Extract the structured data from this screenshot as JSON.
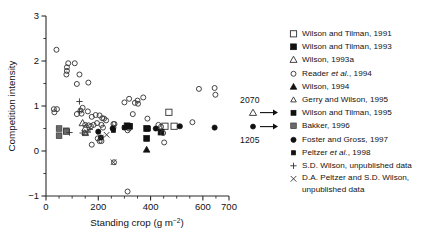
{
  "chart_data": {
    "type": "scatter",
    "title": "",
    "xlabel": "Standing crop (g m−2)",
    "ylabel": "Competition intensity",
    "xlim": [
      0,
      700
    ],
    "ylim": [
      -1,
      3
    ],
    "xticks": [
      0,
      200,
      400,
      600,
      700
    ],
    "xtick_labels": [
      "0",
      "200",
      "400",
      "600",
      "700"
    ],
    "xminor_step": 50,
    "yticks": [
      -1,
      0,
      1,
      2,
      3
    ],
    "ytick_labels": [
      "−1",
      "0",
      "1",
      "2",
      "3"
    ],
    "yminor_step": 0.5,
    "grid": false,
    "legend_position": "right",
    "annotations": [
      {
        "text": "2070",
        "marker": "open-triangle",
        "arrow": "right"
      },
      {
        "text": "1205",
        "marker": "filled-circle",
        "arrow": "right"
      }
    ],
    "series": [
      {
        "name": "Wilson and Tilman, 1991",
        "marker": "open-square",
        "points": [
          [
            470,
            0.86
          ],
          [
            455,
            0.55
          ],
          [
            490,
            0.55
          ]
        ]
      },
      {
        "name": "Wilson and Tilman, 1993",
        "marker": "filled-square",
        "points": [
          [
            310,
            0.56
          ],
          [
            320,
            0.55
          ],
          [
            385,
            0.5
          ],
          [
            385,
            0.28
          ],
          [
            440,
            0.42
          ]
        ]
      },
      {
        "name": "Wilson, 1993a",
        "marker": "open-triangle-large",
        "points": [
          [
            140,
            0.62
          ],
          [
            150,
            0.5
          ]
        ]
      },
      {
        "name": "Reader et al., 1994",
        "marker": "open-circle",
        "points": [
          [
            40,
            2.25
          ],
          [
            85,
            1.95
          ],
          [
            110,
            1.95
          ],
          [
            80,
            1.86
          ],
          [
            80,
            1.78
          ],
          [
            78,
            1.7
          ],
          [
            128,
            1.7
          ],
          [
            118,
            1.49
          ],
          [
            162,
            1.52
          ],
          [
            30,
            0.93
          ],
          [
            42,
            0.93
          ],
          [
            32,
            0.86
          ],
          [
            132,
            0.9
          ],
          [
            136,
            0.83
          ],
          [
            140,
            0.96
          ],
          [
            118,
            0.82
          ],
          [
            160,
            0.88
          ],
          [
            175,
            0.76
          ],
          [
            190,
            0.8
          ],
          [
            205,
            0.79
          ],
          [
            215,
            0.73
          ],
          [
            222,
            0.72
          ],
          [
            230,
            0.68
          ],
          [
            150,
            0.58
          ],
          [
            163,
            0.57
          ],
          [
            172,
            0.55
          ],
          [
            182,
            0.58
          ],
          [
            195,
            0.62
          ],
          [
            212,
            0.58
          ],
          [
            218,
            0.52
          ],
          [
            175,
            0.14
          ],
          [
            198,
            0.28
          ],
          [
            205,
            0.22
          ],
          [
            212,
            0.22
          ],
          [
            258,
            0.52
          ],
          [
            262,
            0.6
          ],
          [
            300,
            1.08
          ],
          [
            318,
            1.16
          ],
          [
            340,
            1.07
          ],
          [
            350,
            1.12
          ],
          [
            352,
            1.05
          ],
          [
            372,
            1.19
          ],
          [
            332,
            0.82
          ],
          [
            388,
            0.72
          ],
          [
            300,
            0.52
          ],
          [
            312,
            0.46
          ],
          [
            318,
            0.5
          ],
          [
            430,
            0.58
          ],
          [
            440,
            0.54
          ],
          [
            448,
            0.4
          ],
          [
            452,
            0.19
          ],
          [
            560,
            0.64
          ],
          [
            585,
            1.38
          ],
          [
            645,
            1.4
          ],
          [
            648,
            1.25
          ],
          [
            260,
            -0.25
          ],
          [
            312,
            -0.9
          ],
          [
            258,
            0.6
          ]
        ]
      },
      {
        "name": "Wilson, 1994",
        "marker": "filled-triangle",
        "points": [
          [
            385,
            0.03
          ]
        ]
      },
      {
        "name": "Gerry and Wilson, 1995",
        "marker": "open-triangle-small",
        "points": [
          [
            148,
            0.41
          ],
          [
            152,
            0.39
          ]
        ]
      },
      {
        "name": "Wilson and Tilman, 1995",
        "marker": "filled-square-sm",
        "points": [
          [
            318,
            0.55
          ],
          [
            390,
            0.5
          ]
        ]
      },
      {
        "name": "Bakker, 1996",
        "marker": "gray-square",
        "points": [
          [
            50,
            0.5
          ],
          [
            50,
            0.34
          ],
          [
            78,
            0.45
          ],
          [
            78,
            0.43
          ]
        ]
      },
      {
        "name": "Foster and Gross, 1997",
        "marker": "filled-circle",
        "points": [
          [
            200,
            0.43
          ],
          [
            210,
            0.3
          ],
          [
            255,
            0.5
          ],
          [
            420,
            0.5
          ],
          [
            512,
            0.55
          ],
          [
            645,
            0.52
          ]
        ]
      },
      {
        "name": "Peltzer et al., 1998",
        "marker": "filled-square-tiny",
        "points": [
          [
            258,
            0.46
          ],
          [
            300,
            0.52
          ]
        ]
      },
      {
        "name": "S.D. Wilson, unpublished data",
        "marker": "plus",
        "points": [
          [
            128,
            1.1
          ],
          [
            90,
            0.41
          ],
          [
            140,
            0.4
          ],
          [
            160,
            0.42
          ],
          [
            168,
            0.48
          ],
          [
            128,
            0.88
          ]
        ]
      },
      {
        "name": "D.A. Peltzer and S.D. Wilson, unpublished data",
        "marker": "cross",
        "points": [
          [
            232,
            0.36
          ],
          [
            258,
            -0.25
          ],
          [
            210,
            0.3
          ]
        ]
      }
    ]
  },
  "axes": {
    "ylabel": "Competition intensity",
    "xlabel_prefix": "Standing crop (g m",
    "xlabel_sup": "−2",
    "xlabel_suffix": ")"
  },
  "legend": {
    "items": [
      {
        "marker": "open-square",
        "label": "Wilson and Tilman, 1991"
      },
      {
        "marker": "filled-square",
        "label": "Wilson and Tilman, 1993"
      },
      {
        "marker": "open-triangle-large",
        "label": "Wilson, 1993a"
      },
      {
        "marker": "open-circle",
        "label": "Reader et al., 1994",
        "italic": "et al."
      },
      {
        "marker": "filled-triangle",
        "label": "Wilson, 1994"
      },
      {
        "marker": "open-triangle-small",
        "label": "Gerry and Wilson, 1995"
      },
      {
        "marker": "filled-square-sm",
        "label": "Wilson and Tilman, 1995"
      },
      {
        "marker": "gray-square",
        "label": "Bakker, 1996"
      },
      {
        "marker": "filled-circle",
        "label": "Foster and Gross, 1997"
      },
      {
        "marker": "filled-square-tiny",
        "label": "Peltzer et al., 1998",
        "italic": "et al."
      },
      {
        "marker": "plus",
        "label": "S.D. Wilson, unpublished data"
      },
      {
        "marker": "cross",
        "label": "D.A. Peltzer and S.D. Wilson, unpublished data"
      }
    ]
  },
  "annotations": {
    "top_value": "2070",
    "bottom_value": "1205"
  }
}
